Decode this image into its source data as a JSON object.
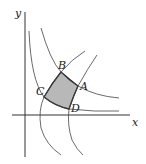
{
  "diagram": {
    "axes": {
      "x_label": "x",
      "y_label": "y"
    },
    "points": [
      {
        "label": "A",
        "name": "point-a"
      },
      {
        "label": "B",
        "name": "point-b"
      },
      {
        "label": "C",
        "name": "point-c"
      },
      {
        "label": "D",
        "name": "point-d"
      }
    ],
    "region": {
      "description": "shaded curvilinear quadrilateral ABCD",
      "fill": "#b8b8b8"
    },
    "colors": {
      "stroke": "#333333",
      "shade": "#b8b8b8"
    }
  }
}
